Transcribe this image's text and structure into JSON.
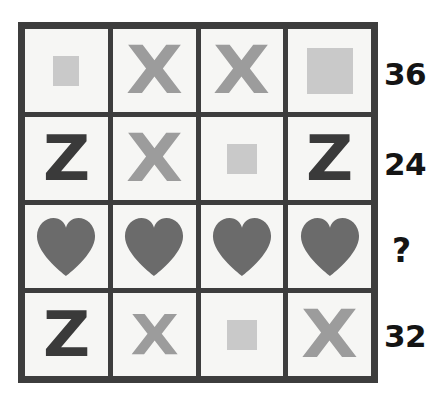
{
  "puzzle": {
    "type": "symbol-weight-grid",
    "grid_size": "4x4",
    "colors": {
      "border": "#3d3d3d",
      "cell_background": "#f6f6f4",
      "square_fill": "#c9c9c9",
      "x_fill": "#9c9c9c",
      "z_fill": "#3a3a3a",
      "heart_fill": "#6b6b6b",
      "value_text": "#141414",
      "page_background": "#ffffff"
    },
    "rows": [
      {
        "value": "36",
        "is_unknown": false,
        "cells": [
          {
            "symbol": "square",
            "size": "small",
            "label": "grey-square"
          },
          {
            "symbol": "x",
            "size": "large",
            "label": "grey-x"
          },
          {
            "symbol": "x",
            "size": "large",
            "label": "grey-x"
          },
          {
            "symbol": "square",
            "size": "large",
            "label": "grey-square"
          }
        ]
      },
      {
        "value": "24",
        "is_unknown": false,
        "cells": [
          {
            "symbol": "z",
            "size": "large",
            "label": "dark-z"
          },
          {
            "symbol": "x",
            "size": "large",
            "label": "grey-x"
          },
          {
            "symbol": "square",
            "size": "medium",
            "label": "grey-square"
          },
          {
            "symbol": "z",
            "size": "large",
            "label": "dark-z"
          }
        ]
      },
      {
        "value": "?",
        "is_unknown": true,
        "cells": [
          {
            "symbol": "heart",
            "size": "large",
            "label": "grey-heart"
          },
          {
            "symbol": "heart",
            "size": "large",
            "label": "grey-heart"
          },
          {
            "symbol": "heart",
            "size": "large",
            "label": "grey-heart"
          },
          {
            "symbol": "heart",
            "size": "large",
            "label": "grey-heart"
          }
        ]
      },
      {
        "value": "32",
        "is_unknown": false,
        "cells": [
          {
            "symbol": "z",
            "size": "large",
            "label": "dark-z"
          },
          {
            "symbol": "x",
            "size": "small",
            "label": "grey-x"
          },
          {
            "symbol": "square",
            "size": "medium",
            "label": "grey-square"
          },
          {
            "symbol": "x",
            "size": "large",
            "label": "grey-x"
          }
        ]
      }
    ],
    "glyph_text": {
      "x": "X",
      "z": "Z"
    }
  }
}
